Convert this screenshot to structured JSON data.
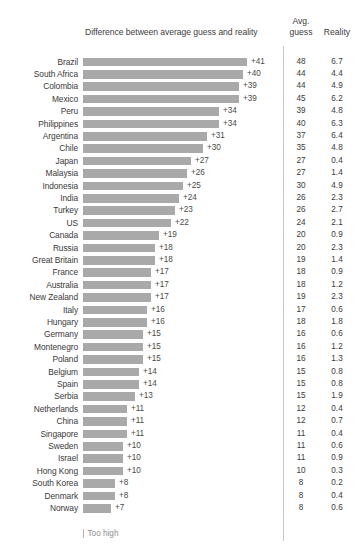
{
  "chart_data": {
    "type": "bar",
    "title": "Difference between average guess and reality",
    "xlabel": "",
    "ylabel": "",
    "orientation": "horizontal",
    "grid": false,
    "legend_position": "bottom-left",
    "legend_entries": [
      "Too high"
    ],
    "value_prefix": "+",
    "xlim": [
      0,
      41
    ],
    "columns": {
      "difference": "Difference between average guess and reality",
      "avg_guess_line1": "Avg.",
      "avg_guess_line2": "guess",
      "reality": "Reality"
    },
    "categories": [
      "Brazil",
      "South Africa",
      "Colombia",
      "Mexico",
      "Peru",
      "Philippines",
      "Argentina",
      "Chile",
      "Japan",
      "Malaysia",
      "Indonesia",
      "India",
      "Turkey",
      "US",
      "Canada",
      "Russia",
      "Great Britain",
      "France",
      "Australia",
      "New Zealand",
      "Italy",
      "Hungary",
      "Germany",
      "Montenegro",
      "Poland",
      "Belgium",
      "Spain",
      "Serbia",
      "Netherlands",
      "China",
      "Singapore",
      "Sweden",
      "Israel",
      "Hong Kong",
      "South Korea",
      "Denmark",
      "Norway"
    ],
    "values": [
      41,
      40,
      39,
      39,
      34,
      34,
      31,
      30,
      27,
      26,
      25,
      24,
      23,
      22,
      19,
      18,
      18,
      17,
      17,
      17,
      16,
      16,
      15,
      15,
      15,
      14,
      14,
      13,
      11,
      11,
      11,
      10,
      10,
      10,
      8,
      8,
      7
    ],
    "value_labels": [
      "+41",
      "+40",
      "+39",
      "+39",
      "+34",
      "+34",
      "+31",
      "+30",
      "+27",
      "+26",
      "+25",
      "+24",
      "+23",
      "+22",
      "+19",
      "+18",
      "+18",
      "+17",
      "+17",
      "+17",
      "+16",
      "+16",
      "+15",
      "+15",
      "+15",
      "+14",
      "+14",
      "+13",
      "+11",
      "+11",
      "+11",
      "+10",
      "+10",
      "+10",
      "+8",
      "+8",
      "+7"
    ],
    "series": [
      {
        "name": "Avg. guess",
        "values": [
          48,
          44,
          44,
          45,
          39,
          40,
          37,
          35,
          27,
          27,
          30,
          26,
          26,
          24,
          20,
          20,
          19,
          18,
          18,
          19,
          17,
          18,
          16,
          16,
          16,
          15,
          15,
          15,
          12,
          12,
          11,
          11,
          11,
          10,
          8,
          8,
          8
        ]
      },
      {
        "name": "Reality",
        "values": [
          6.7,
          4.4,
          4.9,
          6.2,
          4.8,
          6.3,
          6.4,
          4.8,
          0.4,
          1.4,
          4.9,
          2.3,
          2.7,
          2.1,
          0.9,
          2.3,
          1.4,
          0.9,
          1.2,
          2.3,
          0.6,
          1.8,
          0.6,
          1.2,
          1.3,
          0.8,
          0.8,
          1.9,
          0.4,
          0.7,
          0.4,
          0.6,
          0.9,
          0.3,
          0.2,
          0.4,
          0.6
        ]
      }
    ],
    "rows": [
      {
        "label": "Brazil",
        "value": 41,
        "value_label": "+41",
        "avg_guess": "48",
        "reality": "6.7"
      },
      {
        "label": "South Africa",
        "value": 40,
        "value_label": "+40",
        "avg_guess": "44",
        "reality": "4.4"
      },
      {
        "label": "Colombia",
        "value": 39,
        "value_label": "+39",
        "avg_guess": "44",
        "reality": "4.9"
      },
      {
        "label": "Mexico",
        "value": 39,
        "value_label": "+39",
        "avg_guess": "45",
        "reality": "6.2"
      },
      {
        "label": "Peru",
        "value": 34,
        "value_label": "+34",
        "avg_guess": "39",
        "reality": "4.8"
      },
      {
        "label": "Philippines",
        "value": 34,
        "value_label": "+34",
        "avg_guess": "40",
        "reality": "6.3"
      },
      {
        "label": "Argentina",
        "value": 31,
        "value_label": "+31",
        "avg_guess": "37",
        "reality": "6.4"
      },
      {
        "label": "Chile",
        "value": 30,
        "value_label": "+30",
        "avg_guess": "35",
        "reality": "4.8"
      },
      {
        "label": "Japan",
        "value": 27,
        "value_label": "+27",
        "avg_guess": "27",
        "reality": "0.4"
      },
      {
        "label": "Malaysia",
        "value": 26,
        "value_label": "+26",
        "avg_guess": "27",
        "reality": "1.4"
      },
      {
        "label": "Indonesia",
        "value": 25,
        "value_label": "+25",
        "avg_guess": "30",
        "reality": "4.9"
      },
      {
        "label": "India",
        "value": 24,
        "value_label": "+24",
        "avg_guess": "26",
        "reality": "2.3"
      },
      {
        "label": "Turkey",
        "value": 23,
        "value_label": "+23",
        "avg_guess": "26",
        "reality": "2.7"
      },
      {
        "label": "US",
        "value": 22,
        "value_label": "+22",
        "avg_guess": "24",
        "reality": "2.1"
      },
      {
        "label": "Canada",
        "value": 19,
        "value_label": "+19",
        "avg_guess": "20",
        "reality": "0.9"
      },
      {
        "label": "Russia",
        "value": 18,
        "value_label": "+18",
        "avg_guess": "20",
        "reality": "2.3"
      },
      {
        "label": "Great Britain",
        "value": 18,
        "value_label": "+18",
        "avg_guess": "19",
        "reality": "1.4"
      },
      {
        "label": "France",
        "value": 17,
        "value_label": "+17",
        "avg_guess": "18",
        "reality": "0.9"
      },
      {
        "label": "Australia",
        "value": 17,
        "value_label": "+17",
        "avg_guess": "18",
        "reality": "1.2"
      },
      {
        "label": "New Zealand",
        "value": 17,
        "value_label": "+17",
        "avg_guess": "19",
        "reality": "2.3"
      },
      {
        "label": "Italy",
        "value": 16,
        "value_label": "+16",
        "avg_guess": "17",
        "reality": "0.6"
      },
      {
        "label": "Hungary",
        "value": 16,
        "value_label": "+16",
        "avg_guess": "18",
        "reality": "1.8"
      },
      {
        "label": "Germany",
        "value": 15,
        "value_label": "+15",
        "avg_guess": "16",
        "reality": "0.6"
      },
      {
        "label": "Montenegro",
        "value": 15,
        "value_label": "+15",
        "avg_guess": "16",
        "reality": "1.2"
      },
      {
        "label": "Poland",
        "value": 15,
        "value_label": "+15",
        "avg_guess": "16",
        "reality": "1.3"
      },
      {
        "label": "Belgium",
        "value": 14,
        "value_label": "+14",
        "avg_guess": "15",
        "reality": "0.8"
      },
      {
        "label": "Spain",
        "value": 14,
        "value_label": "+14",
        "avg_guess": "15",
        "reality": "0.8"
      },
      {
        "label": "Serbia",
        "value": 13,
        "value_label": "+13",
        "avg_guess": "15",
        "reality": "1.9"
      },
      {
        "label": "Netherlands",
        "value": 11,
        "value_label": "+11",
        "avg_guess": "12",
        "reality": "0.4"
      },
      {
        "label": "China",
        "value": 11,
        "value_label": "+11",
        "avg_guess": "12",
        "reality": "0.7"
      },
      {
        "label": "Singapore",
        "value": 11,
        "value_label": "+11",
        "avg_guess": "11",
        "reality": "0.4"
      },
      {
        "label": "Sweden",
        "value": 10,
        "value_label": "+10",
        "avg_guess": "11",
        "reality": "0.6"
      },
      {
        "label": "Israel",
        "value": 10,
        "value_label": "+10",
        "avg_guess": "11",
        "reality": "0.9"
      },
      {
        "label": "Hong Kong",
        "value": 10,
        "value_label": "+10",
        "avg_guess": "10",
        "reality": "0.3"
      },
      {
        "label": "South Korea",
        "value": 8,
        "value_label": "+8",
        "avg_guess": "8",
        "reality": "0.2"
      },
      {
        "label": "Denmark",
        "value": 8,
        "value_label": "+8",
        "avg_guess": "8",
        "reality": "0.4"
      },
      {
        "label": "Norway",
        "value": 7,
        "value_label": "+7",
        "avg_guess": "8",
        "reality": "0.6"
      }
    ],
    "legend": {
      "label": "Too high"
    },
    "colors": {
      "bar": "#a9a9a9",
      "text": "#3a3a3a",
      "legend_text": "#8e8e8e",
      "separator": "#c9c9c9"
    }
  }
}
